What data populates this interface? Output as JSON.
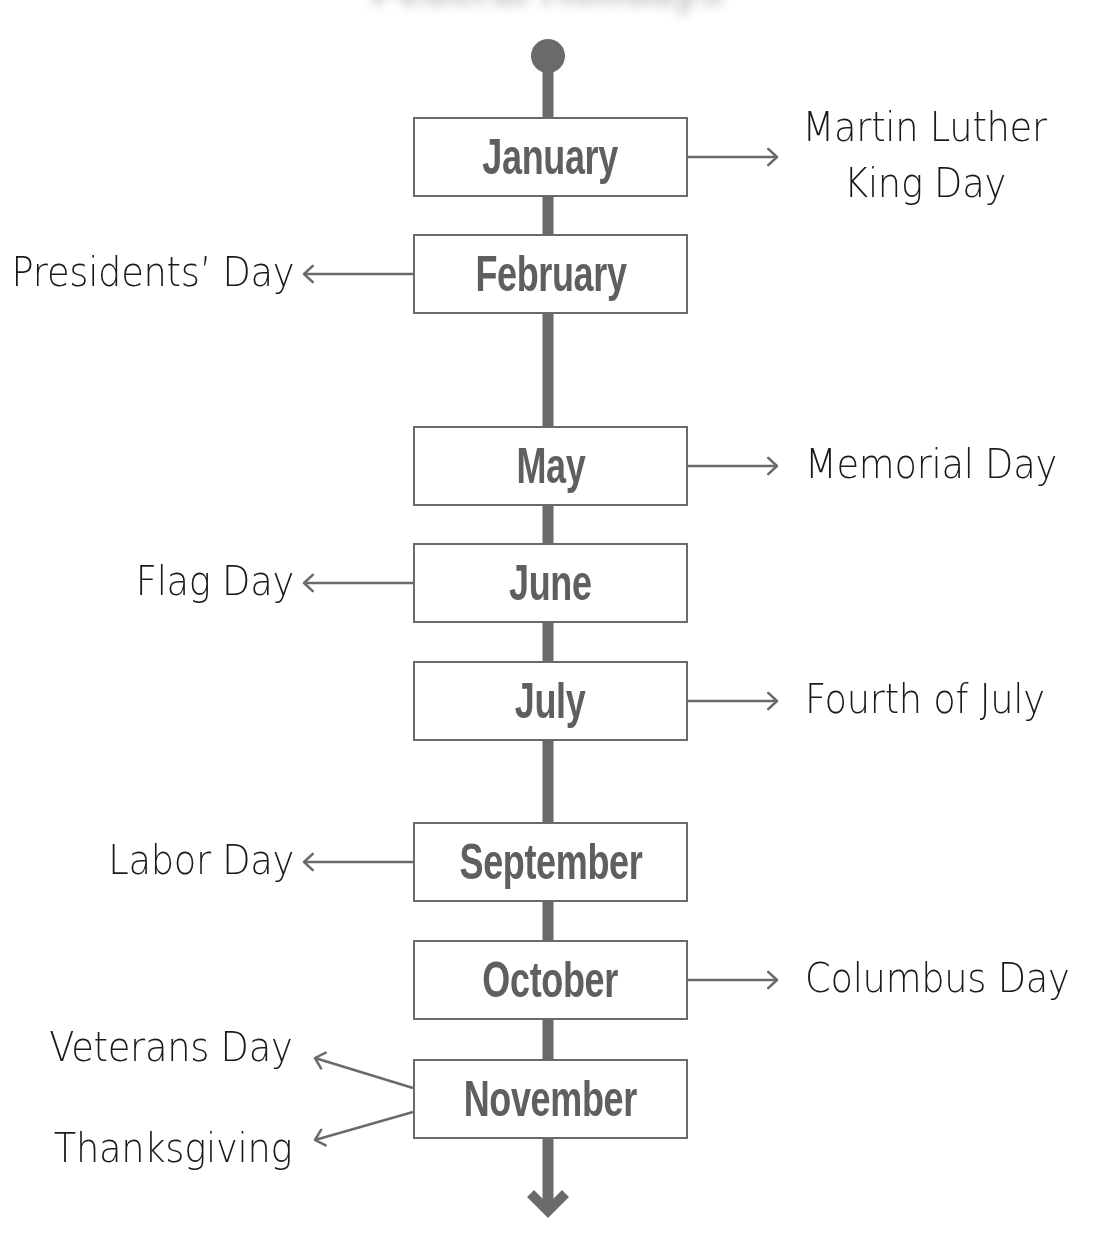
{
  "diagram": {
    "type": "timeline",
    "title_fragment": "Federal Holidays",
    "colors": {
      "line": "#6a6a6a",
      "box_border": "#6a6a6a",
      "month_text": "#5f5f5f",
      "holiday_text": "#1a1a1a",
      "background": "#ffffff"
    },
    "spine": {
      "x": 548,
      "width": 11,
      "start_dot": {
        "cx": 548,
        "cy": 56,
        "r": 17
      },
      "top": 56,
      "bottom": 1212,
      "end_arrow": "arrow-down"
    },
    "months": [
      {
        "label": "January",
        "top": 117,
        "holidays": [
          {
            "side": "right",
            "lines": [
              "Martin Luther",
              "King Day"
            ]
          }
        ]
      },
      {
        "label": "February",
        "top": 234,
        "holidays": [
          {
            "side": "left",
            "lines": [
              "Presidents’ Day"
            ]
          }
        ]
      },
      {
        "label": "May",
        "top": 426,
        "holidays": [
          {
            "side": "right",
            "lines": [
              "Memorial Day"
            ]
          }
        ]
      },
      {
        "label": "June",
        "top": 543,
        "holidays": [
          {
            "side": "left",
            "lines": [
              "Flag Day"
            ]
          }
        ]
      },
      {
        "label": "July",
        "top": 661,
        "holidays": [
          {
            "side": "right",
            "lines": [
              "Fourth of July"
            ]
          }
        ]
      },
      {
        "label": "September",
        "top": 822,
        "holidays": [
          {
            "side": "left",
            "lines": [
              "Labor Day"
            ]
          }
        ]
      },
      {
        "label": "October",
        "top": 940,
        "holidays": [
          {
            "side": "right",
            "lines": [
              "Columbus Day"
            ]
          }
        ]
      },
      {
        "label": "November",
        "top": 1059,
        "holidays": [
          {
            "side": "left-up",
            "lines": [
              "Veterans Day"
            ]
          },
          {
            "side": "left-down",
            "lines": [
              "Thanksgiving"
            ]
          }
        ]
      }
    ]
  }
}
